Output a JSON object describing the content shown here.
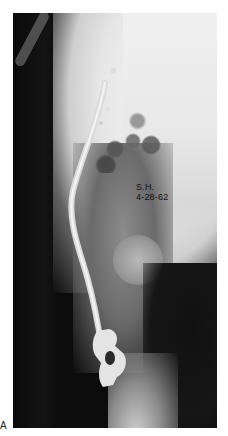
{
  "figure": {
    "panel_label": "A",
    "image_type": "radiograph",
    "annotation": {
      "line1": "S.H.",
      "line2": "4-28-62"
    },
    "colors": {
      "background": "#ffffff",
      "film_dark": "#0c0c0c",
      "film_bright": "#f0f0f0",
      "implant": "#e8e8e8"
    }
  }
}
